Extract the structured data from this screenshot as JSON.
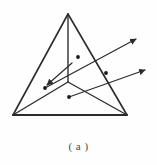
{
  "figure": {
    "caption": "( a )",
    "label": "a",
    "type": "tetrahedron-ray-diagram",
    "colors": {
      "background": "#fefefe",
      "edge": "#2b2b2b",
      "ray": "#2b2b2b",
      "node": "#1a1a1a",
      "caption": "#4a4a4a"
    },
    "vertices": {
      "apex": {
        "name": "apex",
        "x": 68,
        "y": 14
      },
      "bottom_left": {
        "name": "bottom-left",
        "x": 13,
        "y": 115
      },
      "bottom_right": {
        "name": "bottom-right",
        "x": 127,
        "y": 115
      },
      "back_center": {
        "name": "back-center",
        "x": 68,
        "y": 82
      }
    },
    "edges": [
      {
        "name": "apex-to-bottom-left",
        "from": "apex",
        "to": "bottom_left",
        "style": "solid"
      },
      {
        "name": "apex-to-bottom-right",
        "from": "apex",
        "to": "bottom_right",
        "style": "solid"
      },
      {
        "name": "bottom-base",
        "from": "bottom_left",
        "to": "bottom_right",
        "style": "solid-thick"
      },
      {
        "name": "apex-to-back-center",
        "from": "apex",
        "to": "back_center",
        "style": "solid"
      },
      {
        "name": "back-center-to-bottom-left",
        "from": "back_center",
        "to": "bottom_left",
        "style": "solid"
      },
      {
        "name": "back-center-to-bottom-right",
        "from": "back_center",
        "to": "bottom_right",
        "style": "solid"
      }
    ],
    "rays": [
      {
        "name": "upper-ray",
        "from_x": 45,
        "from_y": 88,
        "to_x": 136,
        "to_y": 39,
        "arrowhead": "end",
        "dots": [
          {
            "x": 45,
            "y": 88
          },
          {
            "x": 78,
            "y": 57
          }
        ]
      },
      {
        "name": "lower-ray",
        "from_x": 69,
        "from_y": 97,
        "to_x": 145,
        "to_y": 70,
        "arrowhead": "end",
        "dots": [
          {
            "x": 69,
            "y": 97
          },
          {
            "x": 106,
            "y": 73
          }
        ]
      },
      {
        "name": "incoming-ray-to-node",
        "from_x": 72,
        "from_y": 63,
        "to_x": 47,
        "to_y": 85,
        "arrowhead": "end",
        "dots": []
      }
    ]
  }
}
